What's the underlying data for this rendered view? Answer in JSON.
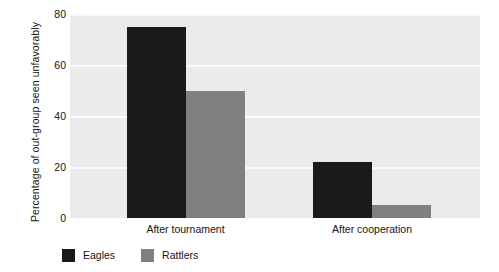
{
  "chart_data": {
    "type": "bar",
    "title": "",
    "xlabel": "",
    "ylabel": "Percentage of out-group seen unfavorably",
    "categories": [
      "After tournament",
      "After cooperation"
    ],
    "series": [
      {
        "name": "Eagles",
        "color": "#1a1a1a",
        "values": [
          75,
          22
        ]
      },
      {
        "name": "Rattlers",
        "color": "#808080",
        "values": [
          50,
          5
        ]
      }
    ],
    "ylim": [
      0,
      80
    ],
    "yticks": [
      0,
      20,
      40,
      60,
      80
    ],
    "ytick_labels": [
      "0",
      "20",
      "40",
      "60",
      "80"
    ],
    "grid": true,
    "grid_color": "#fafafa",
    "plot_background": "#ebebeb",
    "legend_position": "bottom-left"
  },
  "legend": {
    "entries": [
      {
        "label": "Eagles",
        "swatch": "#1a1a1a"
      },
      {
        "label": "Rattlers",
        "swatch": "#808080"
      }
    ]
  }
}
